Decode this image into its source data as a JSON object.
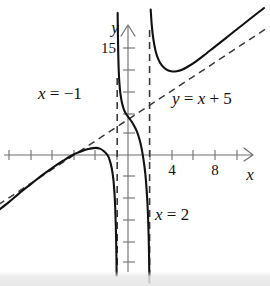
{
  "figure": {
    "kind": "cartesian-graph",
    "background_color": "#ffffff",
    "curve_color": "#111111",
    "asymptote_color": "#3a3a3a",
    "axis_color": "#6e6e6e"
  },
  "axes": {
    "x_axis_label": "x",
    "y_axis_label": "y",
    "x_tick_labels": [
      "4",
      "8"
    ],
    "y_tick_labels": [
      "15"
    ],
    "x_tick_values": [
      4,
      8
    ],
    "y_tick_values": [
      15
    ],
    "x_range": [
      -12,
      13
    ],
    "y_range": [
      -18,
      21
    ],
    "origin_px": [
      128,
      155
    ],
    "px_per_unit_x": 10.8,
    "px_per_unit_y": 7.1,
    "x_tick_step": 2,
    "y_tick_step": 3,
    "grid": false
  },
  "annotations": [
    {
      "name": "left-vertical-asymptote-label",
      "text": "x = −1",
      "x_px": 38,
      "y_px": 99
    },
    {
      "name": "slant-asymptote-label",
      "text": "y = x + 5",
      "x_px": 172,
      "y_px": 104
    },
    {
      "name": "right-vertical-asymptote-label",
      "text": "x = 2",
      "x_px": 155,
      "y_px": 220
    }
  ],
  "chart_data": {
    "type": "line",
    "title": "",
    "xlabel": "x",
    "ylabel": "y",
    "xlim": [
      -12,
      13
    ],
    "ylim": [
      -18,
      21
    ],
    "grid": false,
    "legend_position": "none",
    "x_ticks": [
      4,
      8
    ],
    "y_ticks": [
      15
    ],
    "asymptotes": {
      "vertical": [
        {
          "label": "x = −1",
          "x": -1,
          "style": "dashed"
        },
        {
          "label": "x = 2",
          "x": 2,
          "style": "dashed"
        }
      ],
      "slant": [
        {
          "label": "y = x + 5",
          "slope": 1,
          "intercept": 5,
          "style": "dashed"
        }
      ]
    },
    "series": [
      {
        "name": "left-branch",
        "style": "solid",
        "domain": [
          -12,
          -1
        ],
        "points": [
          [
            -12.0,
            -7.8
          ],
          [
            -11.0,
            -6.6
          ],
          [
            -10.0,
            -5.3
          ],
          [
            -9.0,
            -4.1
          ],
          [
            -8.0,
            -2.9
          ],
          [
            -7.0,
            -1.8
          ],
          [
            -6.0,
            -0.8
          ],
          [
            -5.0,
            0.1
          ],
          [
            -4.0,
            0.7
          ],
          [
            -3.5,
            0.9
          ],
          [
            -3.0,
            1.0
          ],
          [
            -2.6,
            0.9
          ],
          [
            -2.2,
            0.5
          ],
          [
            -1.9,
            0.0
          ],
          [
            -1.7,
            -0.7
          ],
          [
            -1.5,
            -1.9
          ],
          [
            -1.35,
            -3.5
          ],
          [
            -1.25,
            -5.4
          ],
          [
            -1.18,
            -7.6
          ],
          [
            -1.12,
            -10.5
          ],
          [
            -1.08,
            -13.5
          ],
          [
            -1.05,
            -17.0
          ]
        ]
      },
      {
        "name": "middle-branch",
        "style": "solid",
        "domain": [
          -1,
          2
        ],
        "points": [
          [
            -0.96,
            20.0
          ],
          [
            -0.93,
            16.5
          ],
          [
            -0.9,
            14.0
          ],
          [
            -0.86,
            12.0
          ],
          [
            -0.8,
            10.2
          ],
          [
            -0.7,
            8.6
          ],
          [
            -0.55,
            7.3
          ],
          [
            -0.35,
            6.3
          ],
          [
            -0.1,
            5.6
          ],
          [
            0.2,
            5.0
          ],
          [
            0.5,
            4.3
          ],
          [
            0.8,
            3.4
          ],
          [
            1.05,
            2.3
          ],
          [
            1.25,
            1.0
          ],
          [
            1.45,
            -0.8
          ],
          [
            1.6,
            -2.6
          ],
          [
            1.72,
            -4.8
          ],
          [
            1.82,
            -7.4
          ],
          [
            1.88,
            -9.8
          ],
          [
            1.93,
            -12.6
          ],
          [
            1.96,
            -15.4
          ],
          [
            1.98,
            -18.0
          ]
        ]
      },
      {
        "name": "right-branch",
        "style": "solid",
        "domain": [
          2,
          13
        ],
        "points": [
          [
            2.1,
            20.5
          ],
          [
            2.2,
            18.3
          ],
          [
            2.35,
            16.3
          ],
          [
            2.55,
            14.7
          ],
          [
            2.8,
            13.5
          ],
          [
            3.1,
            12.7
          ],
          [
            3.5,
            12.1
          ],
          [
            4.0,
            11.8
          ],
          [
            4.5,
            11.8
          ],
          [
            5.0,
            12.0
          ],
          [
            5.6,
            12.5
          ],
          [
            6.3,
            13.2
          ],
          [
            7.0,
            14.0
          ],
          [
            8.0,
            15.2
          ],
          [
            9.0,
            16.4
          ],
          [
            10.0,
            17.6
          ],
          [
            11.0,
            18.8
          ],
          [
            12.0,
            20.0
          ],
          [
            12.6,
            20.7
          ]
        ]
      }
    ]
  }
}
